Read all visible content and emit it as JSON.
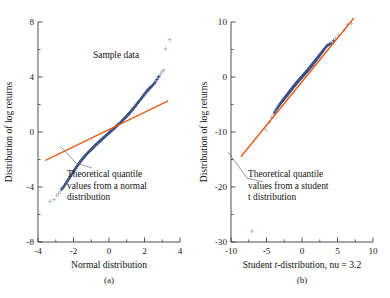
{
  "figure": {
    "kind": "qq-plot-pair",
    "background": "#ffffff",
    "marker_color": "#3b5183",
    "marker_outlier_color": "#9aa7c4",
    "line_color": "#e4601f",
    "axis_color": "#3c3c3c"
  },
  "panels": [
    {
      "id": "a",
      "tag": "(a)",
      "xlabel": "Normal distribution",
      "ylabel": "Distribution of log returns",
      "annotations": [
        {
          "name": "sample-data-label",
          "text": "Sample data"
        },
        {
          "name": "theoretical-quantile-label",
          "lines": [
            "Theoretical quantile",
            "values from a normal",
            "distribution"
          ]
        }
      ]
    },
    {
      "id": "b",
      "tag": "(b)",
      "xlabel_parts": {
        "pre": "Student ",
        "em": "t",
        "post": "-distribution, nu = 3.2"
      },
      "xlabel": "Student t-distribution, nu = 3.2",
      "ylabel": "Distribution of log returns",
      "annotations": [
        {
          "name": "theoretical-quantile-label",
          "lines": [
            "Theoretical quantile",
            "values from a student",
            "t distribution"
          ]
        }
      ]
    }
  ],
  "chart_data": [
    {
      "type": "scatter",
      "panel": "a",
      "title": "",
      "xlabel": "Normal distribution",
      "ylabel": "Distribution of log returns",
      "xlim": [
        -4,
        4
      ],
      "ylim": [
        -8,
        8
      ],
      "xticks": [
        -4,
        -2,
        0,
        2,
        4
      ],
      "xtick_labels": [
        "-4",
        "-2",
        "0",
        "2",
        "4"
      ],
      "yticks": [
        -8,
        -4,
        0,
        4,
        8
      ],
      "ytick_labels": [
        "-8",
        "-4",
        "0",
        "4",
        "8"
      ],
      "minor_xticks": [
        -3,
        -1,
        1,
        3
      ],
      "minor_yticks": [
        -6,
        -2,
        2,
        6
      ],
      "grid": false,
      "legend": "none",
      "series": [
        {
          "name": "Sample data",
          "marker": "plus",
          "color": "#3b5183",
          "points": [
            [
              -3.32,
              -5.05
            ],
            [
              -3.1,
              -4.92
            ],
            [
              -2.95,
              -4.62
            ],
            [
              -2.84,
              -4.47
            ],
            [
              -2.74,
              -4.3
            ],
            [
              -2.66,
              -4.15
            ],
            [
              -2.58,
              -4.02
            ],
            [
              -2.5,
              -3.88
            ],
            [
              -2.43,
              -3.74
            ],
            [
              -2.36,
              -3.6
            ],
            [
              -2.3,
              -3.48
            ],
            [
              -2.24,
              -3.36
            ],
            [
              -2.18,
              -3.24
            ],
            [
              -2.12,
              -3.12
            ],
            [
              -2.06,
              -3.0
            ],
            [
              -2.0,
              -2.88
            ],
            [
              -1.94,
              -2.76
            ],
            [
              -1.88,
              -2.64
            ],
            [
              -1.82,
              -2.52
            ],
            [
              -1.76,
              -2.41
            ],
            [
              -1.7,
              -2.3
            ],
            [
              -1.64,
              -2.2
            ],
            [
              -1.58,
              -2.1
            ],
            [
              -1.52,
              -2.0
            ],
            [
              -1.46,
              -1.91
            ],
            [
              -1.4,
              -1.82
            ],
            [
              -1.34,
              -1.73
            ],
            [
              -1.28,
              -1.64
            ],
            [
              -1.22,
              -1.56
            ],
            [
              -1.16,
              -1.48
            ],
            [
              -1.1,
              -1.4
            ],
            [
              -1.04,
              -1.32
            ],
            [
              -0.98,
              -1.24
            ],
            [
              -0.92,
              -1.16
            ],
            [
              -0.86,
              -1.08
            ],
            [
              -0.8,
              -1.0
            ],
            [
              -0.74,
              -0.93
            ],
            [
              -0.68,
              -0.86
            ],
            [
              -0.62,
              -0.79
            ],
            [
              -0.56,
              -0.72
            ],
            [
              -0.5,
              -0.65
            ],
            [
              -0.44,
              -0.58
            ],
            [
              -0.38,
              -0.51
            ],
            [
              -0.32,
              -0.44
            ],
            [
              -0.26,
              -0.37
            ],
            [
              -0.2,
              -0.3
            ],
            [
              -0.14,
              -0.23
            ],
            [
              -0.08,
              -0.16
            ],
            [
              -0.02,
              -0.09
            ],
            [
              0.04,
              -0.02
            ],
            [
              0.1,
              0.05
            ],
            [
              0.16,
              0.12
            ],
            [
              0.22,
              0.19
            ],
            [
              0.28,
              0.26
            ],
            [
              0.34,
              0.33
            ],
            [
              0.4,
              0.4
            ],
            [
              0.46,
              0.47
            ],
            [
              0.52,
              0.54
            ],
            [
              0.58,
              0.61
            ],
            [
              0.64,
              0.68
            ],
            [
              0.7,
              0.76
            ],
            [
              0.76,
              0.84
            ],
            [
              0.82,
              0.92
            ],
            [
              0.88,
              1.0
            ],
            [
              0.94,
              1.08
            ],
            [
              1.0,
              1.16
            ],
            [
              1.06,
              1.24
            ],
            [
              1.12,
              1.33
            ],
            [
              1.18,
              1.42
            ],
            [
              1.24,
              1.51
            ],
            [
              1.3,
              1.6
            ],
            [
              1.36,
              1.69
            ],
            [
              1.42,
              1.78
            ],
            [
              1.48,
              1.88
            ],
            [
              1.54,
              1.98
            ],
            [
              1.6,
              2.08
            ],
            [
              1.66,
              2.18
            ],
            [
              1.72,
              2.28
            ],
            [
              1.78,
              2.38
            ],
            [
              1.84,
              2.48
            ],
            [
              1.9,
              2.58
            ],
            [
              1.96,
              2.68
            ],
            [
              2.02,
              2.78
            ],
            [
              2.08,
              2.88
            ],
            [
              2.14,
              2.98
            ],
            [
              2.2,
              3.06
            ],
            [
              2.26,
              3.14
            ],
            [
              2.32,
              3.22
            ],
            [
              2.38,
              3.3
            ],
            [
              2.44,
              3.38
            ],
            [
              2.52,
              3.48
            ],
            [
              2.6,
              3.62
            ],
            [
              2.7,
              3.82
            ],
            [
              2.8,
              4.02
            ],
            [
              2.9,
              4.22
            ],
            [
              3.0,
              4.38
            ],
            [
              3.08,
              4.5
            ],
            [
              3.18,
              6.05
            ],
            [
              3.42,
              6.72
            ]
          ]
        },
        {
          "name": "Theoretical quantile values from a normal distribution",
          "type": "line",
          "color": "#e4601f",
          "endpoints": [
            [
              -3.55,
              -2.05
            ],
            [
              3.3,
              2.25
            ]
          ]
        }
      ]
    },
    {
      "type": "scatter",
      "panel": "b",
      "title": "",
      "xlabel": "Student t-distribution, nu = 3.2",
      "ylabel": "Distribution of log returns",
      "xlim": [
        -10,
        10
      ],
      "ylim": [
        -30,
        10
      ],
      "xticks": [
        -10,
        -5,
        0,
        5,
        10
      ],
      "xtick_labels": [
        "-10",
        "-5",
        "0",
        "5",
        "10"
      ],
      "yticks": [
        -30,
        -20,
        -10,
        0,
        10
      ],
      "ytick_labels": [
        "-30",
        "-20",
        "-10",
        "0",
        "10"
      ],
      "minor_xticks": [
        -7.5,
        -2.5,
        2.5,
        7.5
      ],
      "minor_yticks": [
        -25,
        -15,
        -5,
        5
      ],
      "grid": false,
      "legend": "none",
      "series": [
        {
          "name": "Sample data",
          "marker": "plus",
          "color": "#3b5183",
          "points": [
            [
              -7.05,
              -28.0
            ],
            [
              -5.1,
              -9.6
            ],
            [
              -4.6,
              -8.2
            ],
            [
              -4.3,
              -7.4
            ],
            [
              -4.05,
              -6.85
            ],
            [
              -3.85,
              -6.4
            ],
            [
              -3.65,
              -6.0
            ],
            [
              -3.48,
              -5.65
            ],
            [
              -3.32,
              -5.35
            ],
            [
              -3.18,
              -5.1
            ],
            [
              -3.04,
              -4.85
            ],
            [
              -2.92,
              -4.62
            ],
            [
              -2.8,
              -4.42
            ],
            [
              -2.68,
              -4.22
            ],
            [
              -2.58,
              -4.05
            ],
            [
              -2.47,
              -3.88
            ],
            [
              -2.37,
              -3.72
            ],
            [
              -2.28,
              -3.56
            ],
            [
              -2.18,
              -3.4
            ],
            [
              -2.1,
              -3.26
            ],
            [
              -2.01,
              -3.12
            ],
            [
              -1.93,
              -2.98
            ],
            [
              -1.85,
              -2.85
            ],
            [
              -1.77,
              -2.72
            ],
            [
              -1.7,
              -2.6
            ],
            [
              -1.62,
              -2.47
            ],
            [
              -1.55,
              -2.35
            ],
            [
              -1.48,
              -2.24
            ],
            [
              -1.41,
              -2.12
            ],
            [
              -1.35,
              -2.02
            ],
            [
              -1.28,
              -1.91
            ],
            [
              -1.22,
              -1.81
            ],
            [
              -1.15,
              -1.7
            ],
            [
              -1.09,
              -1.6
            ],
            [
              -1.03,
              -1.51
            ],
            [
              -0.97,
              -1.41
            ],
            [
              -0.91,
              -1.32
            ],
            [
              -0.85,
              -1.22
            ],
            [
              -0.79,
              -1.13
            ],
            [
              -0.73,
              -1.04
            ],
            [
              -0.67,
              -0.95
            ],
            [
              -0.62,
              -0.86
            ],
            [
              -0.56,
              -0.78
            ],
            [
              -0.5,
              -0.69
            ],
            [
              -0.45,
              -0.61
            ],
            [
              -0.39,
              -0.52
            ],
            [
              -0.33,
              -0.44
            ],
            [
              -0.28,
              -0.36
            ],
            [
              -0.22,
              -0.27
            ],
            [
              -0.17,
              -0.19
            ],
            [
              -0.11,
              -0.11
            ],
            [
              -0.06,
              -0.03
            ],
            [
              0.0,
              0.05
            ],
            [
              0.06,
              0.13
            ],
            [
              0.11,
              0.21
            ],
            [
              0.17,
              0.29
            ],
            [
              0.22,
              0.37
            ],
            [
              0.28,
              0.45
            ],
            [
              0.33,
              0.53
            ],
            [
              0.39,
              0.61
            ],
            [
              0.45,
              0.69
            ],
            [
              0.5,
              0.78
            ],
            [
              0.56,
              0.86
            ],
            [
              0.62,
              0.95
            ],
            [
              0.67,
              1.03
            ],
            [
              0.73,
              1.12
            ],
            [
              0.79,
              1.21
            ],
            [
              0.85,
              1.3
            ],
            [
              0.91,
              1.39
            ],
            [
              0.97,
              1.49
            ],
            [
              1.03,
              1.58
            ],
            [
              1.09,
              1.68
            ],
            [
              1.15,
              1.78
            ],
            [
              1.22,
              1.88
            ],
            [
              1.28,
              1.98
            ],
            [
              1.35,
              2.09
            ],
            [
              1.41,
              2.19
            ],
            [
              1.48,
              2.31
            ],
            [
              1.55,
              2.42
            ],
            [
              1.62,
              2.54
            ],
            [
              1.7,
              2.66
            ],
            [
              1.77,
              2.78
            ],
            [
              1.85,
              2.91
            ],
            [
              1.93,
              3.04
            ],
            [
              2.01,
              3.18
            ],
            [
              2.1,
              3.32
            ],
            [
              2.18,
              3.46
            ],
            [
              2.28,
              3.62
            ],
            [
              2.37,
              3.78
            ],
            [
              2.47,
              3.95
            ],
            [
              2.58,
              4.12
            ],
            [
              2.68,
              4.3
            ],
            [
              2.8,
              4.5
            ],
            [
              2.92,
              4.7
            ],
            [
              3.04,
              4.92
            ],
            [
              3.18,
              5.15
            ],
            [
              3.32,
              5.4
            ],
            [
              3.48,
              5.62
            ],
            [
              3.65,
              5.8
            ],
            [
              3.85,
              5.95
            ],
            [
              4.1,
              6.1
            ],
            [
              4.45,
              6.55
            ],
            [
              4.7,
              7.05
            ],
            [
              5.15,
              7.6
            ],
            [
              5.95,
              8.45
            ],
            [
              6.45,
              9.55
            ],
            [
              6.95,
              9.7
            ]
          ]
        },
        {
          "name": "Theoretical quantile values from a student t distribution",
          "type": "line",
          "color": "#e4601f",
          "endpoints": [
            [
              -8.55,
              -14.4
            ],
            [
              7.25,
              10.65
            ]
          ]
        }
      ]
    }
  ]
}
